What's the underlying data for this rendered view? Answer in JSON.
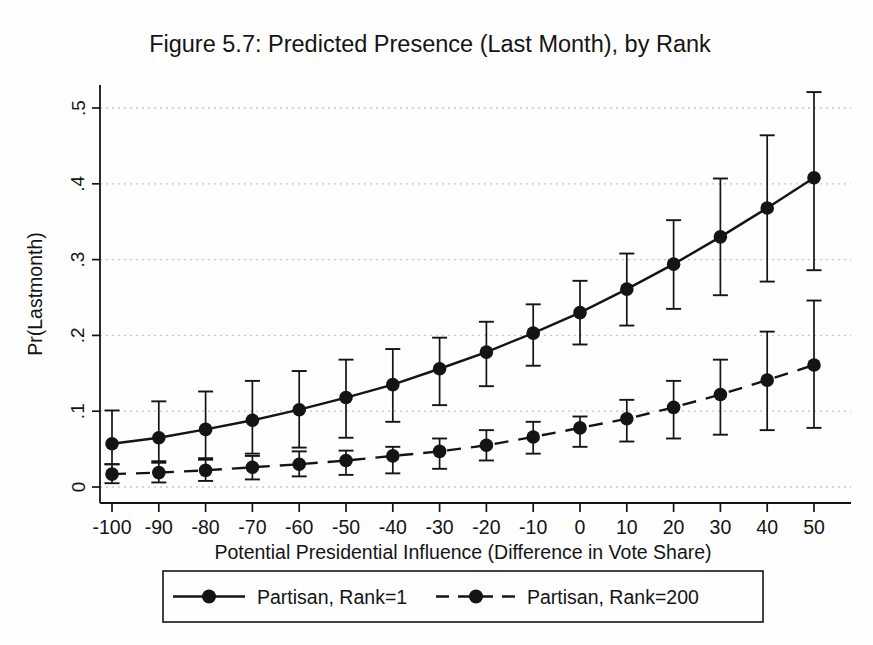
{
  "chart": {
    "title": "Figure 5.7: Predicted Presence (Last Month), by Rank",
    "xlabel": "Potential Presidential Influence (Difference in Vote Share)",
    "ylabel": "Pr(Lastmonth)",
    "legend": {
      "items": [
        {
          "label": "Partisan, Rank=1",
          "line": "solid",
          "marker": "filled-circle"
        },
        {
          "label": "Partisan, Rank=200",
          "line": "dashed",
          "marker": "filled-circle"
        }
      ],
      "position": "bottom"
    }
  },
  "chart_data": {
    "type": "line",
    "title": "Figure 5.7: Predicted Presence (Last Month), by Rank",
    "xlabel": "Potential Presidential Influence (Difference in Vote Share)",
    "ylabel": "Pr(Lastmonth)",
    "x": [
      -100,
      -90,
      -80,
      -70,
      -60,
      -50,
      -40,
      -30,
      -20,
      -10,
      0,
      10,
      20,
      30,
      40,
      50
    ],
    "xtick_labels": [
      "-100",
      "-90",
      "-80",
      "-70",
      "-60",
      "-50",
      "-40",
      "-30",
      "-20",
      "-10",
      "0",
      "10",
      "20",
      "30",
      "40",
      "50"
    ],
    "yticks": [
      0,
      0.1,
      0.2,
      0.3,
      0.4,
      0.5
    ],
    "ytick_labels": [
      "0",
      ".1",
      ".2",
      ".3",
      ".4",
      ".5"
    ],
    "xlim": [
      -102.6,
      57.5
    ],
    "ylim": [
      -0.021,
      0.53
    ],
    "grid": "horizontal-dotted",
    "legend_position": "bottom",
    "error_bars": true,
    "series": [
      {
        "name": "Partisan, Rank=1",
        "line": "solid",
        "marker": "filled-circle",
        "values": [
          0.057,
          0.065,
          0.076,
          0.088,
          0.102,
          0.118,
          0.135,
          0.156,
          0.178,
          0.203,
          0.23,
          0.261,
          0.294,
          0.33,
          0.368,
          0.408
        ],
        "ci_lower": [
          0.03,
          0.034,
          0.038,
          0.044,
          0.052,
          0.065,
          0.086,
          0.108,
          0.133,
          0.16,
          0.188,
          0.213,
          0.235,
          0.253,
          0.271,
          0.286
        ],
        "ci_upper": [
          0.101,
          0.113,
          0.126,
          0.14,
          0.153,
          0.168,
          0.182,
          0.197,
          0.218,
          0.241,
          0.272,
          0.308,
          0.352,
          0.407,
          0.464,
          0.521
        ]
      },
      {
        "name": "Partisan, Rank=200",
        "line": "dashed",
        "marker": "filled-circle",
        "values": [
          0.017,
          0.019,
          0.022,
          0.026,
          0.03,
          0.035,
          0.041,
          0.047,
          0.055,
          0.066,
          0.078,
          0.09,
          0.105,
          0.122,
          0.141,
          0.161
        ],
        "ci_lower": [
          0.005,
          0.006,
          0.008,
          0.01,
          0.014,
          0.016,
          0.018,
          0.024,
          0.035,
          0.044,
          0.053,
          0.06,
          0.064,
          0.069,
          0.075,
          0.078
        ],
        "ci_upper": [
          0.03,
          0.032,
          0.036,
          0.041,
          0.047,
          0.048,
          0.053,
          0.064,
          0.075,
          0.086,
          0.093,
          0.115,
          0.14,
          0.168,
          0.205,
          0.246
        ]
      }
    ],
    "colors": {
      "foreground": "#141414",
      "grid": "#c6c6c6",
      "background": "#fefefe"
    }
  }
}
